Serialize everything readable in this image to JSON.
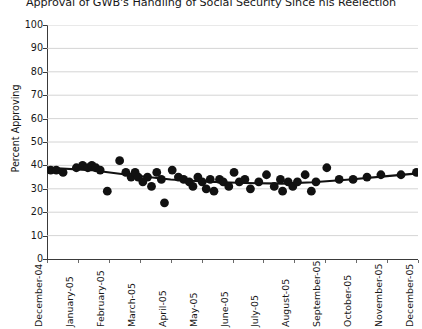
{
  "chart_data": {
    "type": "scatter",
    "title": "Approval of GWB's Handling of Social Security Since his Reelection",
    "xlabel": "",
    "ylabel": "Percent Approving",
    "ylim": [
      0,
      100
    ],
    "ytick_step": 10,
    "yticks": [
      0,
      10,
      20,
      30,
      40,
      50,
      60,
      70,
      80,
      90,
      100
    ],
    "ytick_labels": [
      "0",
      "10",
      "20",
      "30",
      "40",
      "50",
      "60",
      "70",
      "80",
      "90",
      "100"
    ],
    "categories": [
      "December-04",
      "January-05",
      "February-05",
      "March-05",
      "April-05",
      "May-05",
      "June-05",
      "July-05",
      "August-05",
      "September-05",
      "October-05",
      "November-05",
      "December-05"
    ],
    "grid": true,
    "grid_axis": "y",
    "legend": "none",
    "marker_color": "#111111",
    "marker_size": 4.4,
    "trend_color": "#111111",
    "series": [
      {
        "name": "Approval of GWB's Handling of Social Security",
        "points": [
          {
            "x": 0.12,
            "y": 38
          },
          {
            "x": 0.3,
            "y": 38
          },
          {
            "x": 0.52,
            "y": 37
          },
          {
            "x": 0.95,
            "y": 39
          },
          {
            "x": 1.15,
            "y": 40
          },
          {
            "x": 1.32,
            "y": 39
          },
          {
            "x": 1.45,
            "y": 40
          },
          {
            "x": 1.58,
            "y": 39
          },
          {
            "x": 1.72,
            "y": 38
          },
          {
            "x": 1.95,
            "y": 29
          },
          {
            "x": 2.35,
            "y": 42
          },
          {
            "x": 2.55,
            "y": 37
          },
          {
            "x": 2.72,
            "y": 35
          },
          {
            "x": 2.85,
            "y": 37
          },
          {
            "x": 2.95,
            "y": 35
          },
          {
            "x": 3.1,
            "y": 33
          },
          {
            "x": 3.25,
            "y": 35
          },
          {
            "x": 3.38,
            "y": 31
          },
          {
            "x": 3.55,
            "y": 37
          },
          {
            "x": 3.7,
            "y": 34
          },
          {
            "x": 3.8,
            "y": 24
          },
          {
            "x": 4.05,
            "y": 38
          },
          {
            "x": 4.25,
            "y": 35
          },
          {
            "x": 4.42,
            "y": 34
          },
          {
            "x": 4.6,
            "y": 33
          },
          {
            "x": 4.72,
            "y": 31
          },
          {
            "x": 4.88,
            "y": 35
          },
          {
            "x": 5.02,
            "y": 33
          },
          {
            "x": 5.15,
            "y": 30
          },
          {
            "x": 5.28,
            "y": 34
          },
          {
            "x": 5.4,
            "y": 29
          },
          {
            "x": 5.58,
            "y": 34
          },
          {
            "x": 5.7,
            "y": 33
          },
          {
            "x": 5.88,
            "y": 31
          },
          {
            "x": 6.05,
            "y": 37
          },
          {
            "x": 6.22,
            "y": 33
          },
          {
            "x": 6.4,
            "y": 34
          },
          {
            "x": 6.58,
            "y": 30
          },
          {
            "x": 6.85,
            "y": 33
          },
          {
            "x": 7.1,
            "y": 36
          },
          {
            "x": 7.35,
            "y": 31
          },
          {
            "x": 7.55,
            "y": 34
          },
          {
            "x": 7.62,
            "y": 29
          },
          {
            "x": 7.8,
            "y": 33
          },
          {
            "x": 7.95,
            "y": 31
          },
          {
            "x": 8.1,
            "y": 33
          },
          {
            "x": 8.35,
            "y": 36
          },
          {
            "x": 8.55,
            "y": 29
          },
          {
            "x": 8.7,
            "y": 33
          },
          {
            "x": 9.05,
            "y": 39
          },
          {
            "x": 9.45,
            "y": 34
          },
          {
            "x": 9.9,
            "y": 34
          },
          {
            "x": 10.35,
            "y": 35
          },
          {
            "x": 10.8,
            "y": 36
          },
          {
            "x": 11.45,
            "y": 36
          },
          {
            "x": 11.95,
            "y": 37
          }
        ]
      }
    ],
    "trend_line": [
      {
        "x": 0.02,
        "y": 39.0
      },
      {
        "x": 1.4,
        "y": 38.0
      },
      {
        "x": 2.6,
        "y": 36.0
      },
      {
        "x": 4.0,
        "y": 34.0
      },
      {
        "x": 5.2,
        "y": 33.0
      },
      {
        "x": 6.4,
        "y": 32.5
      },
      {
        "x": 7.6,
        "y": 32.2
      },
      {
        "x": 8.6,
        "y": 32.8
      },
      {
        "x": 9.8,
        "y": 34.0
      },
      {
        "x": 11.0,
        "y": 35.4
      },
      {
        "x": 12.0,
        "y": 36.6
      }
    ]
  }
}
